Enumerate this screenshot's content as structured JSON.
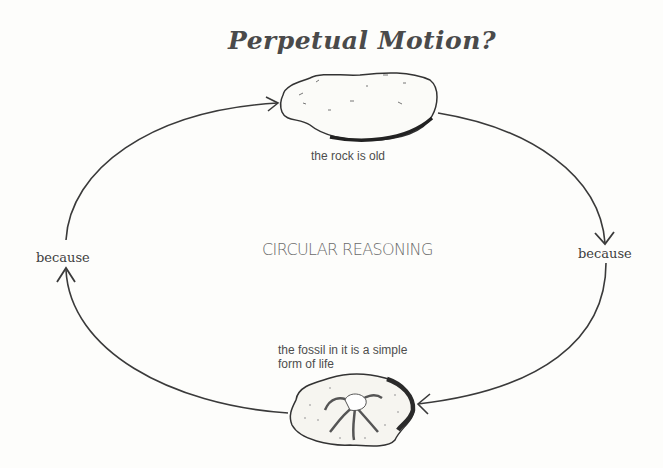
{
  "title": "Perpetual Motion?",
  "center_label": "CIRCULAR REASONING",
  "nodes": [
    {
      "id": "rock",
      "label": "the rock is old"
    },
    {
      "id": "fossil",
      "label_line1": "the fossil in it is a simple",
      "label_line2": "form of life"
    }
  ],
  "edges": [
    {
      "from": "rock",
      "to": "fossil",
      "label": "because",
      "side": "right"
    },
    {
      "from": "fossil",
      "to": "rock",
      "label": "because",
      "side": "left"
    }
  ],
  "colors": {
    "line": "#3a3a3a",
    "text": "#4d4d4d",
    "background": "#fdfdfb"
  }
}
